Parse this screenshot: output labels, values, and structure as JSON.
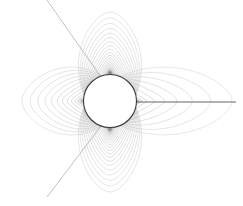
{
  "figure": {
    "title": "",
    "background_color": "#ffffff",
    "width": 243,
    "height": 206
  },
  "chart_data": {
    "type": "line",
    "title": "",
    "subtitle": "",
    "xlabel": "",
    "ylabel": "",
    "xlim": [
      0,
      243
    ],
    "ylim": [
      0,
      206
    ],
    "grid": false,
    "legend": null,
    "annotations": [],
    "body": {
      "name": "central-circle",
      "center_x": 110,
      "center_y": 101,
      "radius": 26.5,
      "stroke": "#3a3a3a",
      "fill": "#ffffff",
      "stroke_width": 1.1
    },
    "contour_color": "#9a9a9a",
    "contour_color_dense": "#777777",
    "separatrix_color": "#8a8a8a",
    "axis_line_color": "#555555",
    "lobes": [
      {
        "name": "top-lobe",
        "direction": "up",
        "contour_count": 26,
        "outer_extent_y": 13,
        "outer_half_width": 45
      },
      {
        "name": "bottom-lobe",
        "direction": "down",
        "contour_count": 26,
        "outer_extent_y": 191,
        "outer_half_width": 45
      },
      {
        "name": "left-lobe",
        "direction": "left",
        "contour_count": 14,
        "outer_extent_x": 22,
        "outer_half_height": 50
      },
      {
        "name": "right-lobe",
        "direction": "right",
        "contour_count": 10,
        "outer_extent_x": 232,
        "outer_half_height": 50
      }
    ],
    "rays": [
      {
        "name": "separatrix-upper-left",
        "x1": 47,
        "y1": 0,
        "x2": 101,
        "y2": 77
      },
      {
        "name": "separatrix-lower-left",
        "x1": 47,
        "y1": 197,
        "x2": 101,
        "y2": 126
      },
      {
        "name": "axis-ray-right",
        "x1": 136,
        "y1": 102,
        "x2": 236,
        "y2": 102
      }
    ]
  }
}
